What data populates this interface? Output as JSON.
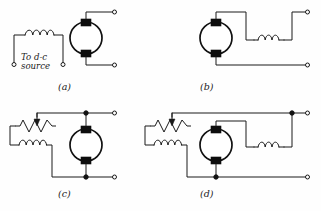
{
  "figure": {
    "background_color": "#fefefe",
    "line_color": "#1a1a1a",
    "brush_color": "#0d0d0d"
  },
  "source_label": {
    "line1": "To d-c",
    "line2": "source"
  },
  "panels": [
    {
      "id": "a",
      "caption": "(a)",
      "name": "shunt-field-and-armature-separate",
      "components": [
        "field-coil",
        "motor-armature",
        "terminal",
        "terminal",
        "terminal",
        "terminal"
      ]
    },
    {
      "id": "b",
      "caption": "(b)",
      "name": "series-motor",
      "components": [
        "motor-armature",
        "series-field-coil",
        "terminal",
        "terminal"
      ]
    },
    {
      "id": "c",
      "caption": "(c)",
      "name": "shunt-motor-with-field-rheostat",
      "components": [
        "field-rheostat",
        "shunt-field-coil",
        "motor-armature",
        "junction-node",
        "junction-node",
        "terminal",
        "terminal"
      ]
    },
    {
      "id": "d",
      "caption": "(d)",
      "name": "compound-motor-with-field-rheostat",
      "components": [
        "field-rheostat",
        "shunt-field-coil",
        "motor-armature",
        "series-field-coil",
        "junction-node",
        "junction-node",
        "terminal",
        "terminal"
      ]
    }
  ],
  "symbols": {
    "motor": "armature-circle-with-brushes",
    "coil": "inductor-loops",
    "rheostat": "zigzag-resistor-with-arrow",
    "terminal": "open-circle-terminal",
    "node": "filled-junction-dot"
  }
}
